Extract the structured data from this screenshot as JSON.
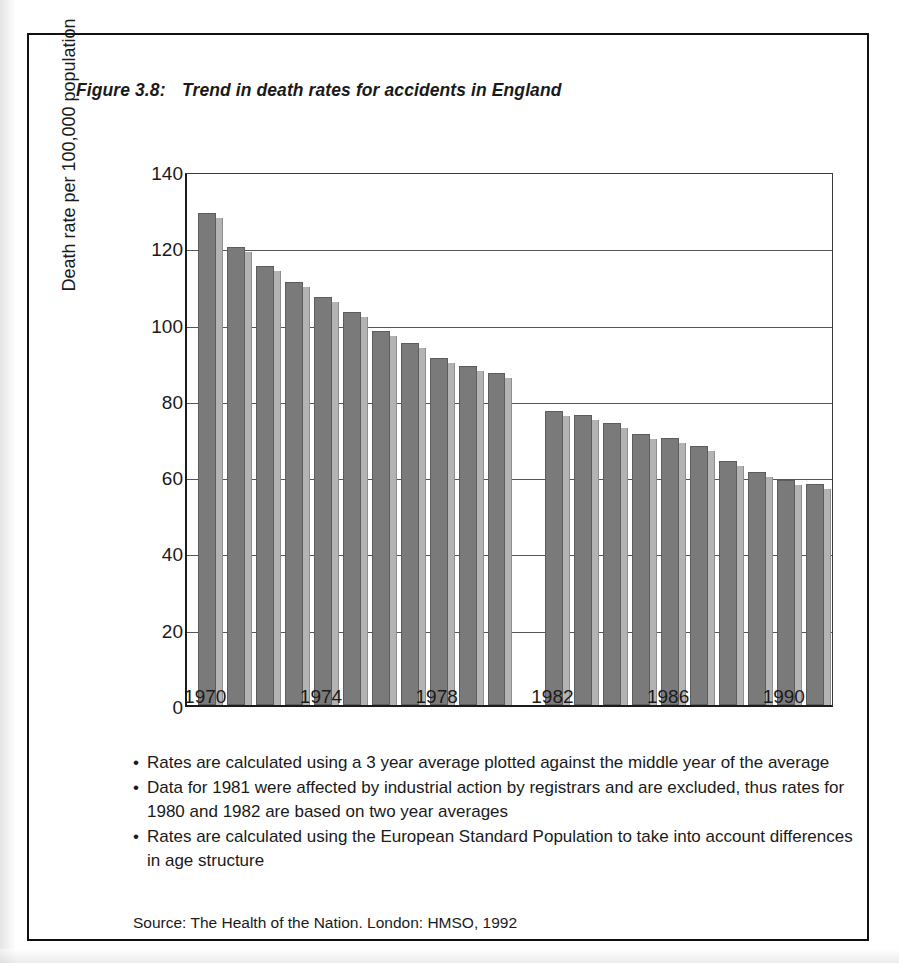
{
  "figure": {
    "number": "Figure 3.8:",
    "title": "Trend in death rates for accidents in England"
  },
  "notes": {
    "bullet_glyph": "•",
    "items": [
      "Rates are calculated using a 3 year average plotted against the middle year of the average",
      "Data for 1981 were affected by industrial action by registrars and are excluded, thus rates for 1980 and 1982 are based on two year averages",
      "Rates are calculated using the European Standard Population to take into account differences in age structure"
    ]
  },
  "source": "Source: The Health of the Nation. London: HMSO, 1992",
  "colors": {
    "bar_face": "#7a7a7a",
    "bar_side": "#b3b3b3",
    "axis": "#1b1b1b",
    "gridline": "#555555",
    "background": "#ffffff"
  },
  "chart_data": {
    "type": "bar",
    "title": "Trend in death rates for accidents in England",
    "xlabel": "",
    "ylabel": "Death rate per 100,000 population",
    "ylim": [
      0,
      140
    ],
    "ytick_values": [
      0,
      20,
      40,
      60,
      80,
      100,
      120,
      140
    ],
    "ytick_labels": [
      "0",
      "20",
      "40",
      "60",
      "80",
      "100",
      "120",
      "140"
    ],
    "xlim": [
      1969.3,
      1991.7
    ],
    "xtick_values": [
      1970,
      1974,
      1978,
      1982,
      1986,
      1990
    ],
    "xtick_labels": [
      "1970",
      "1974",
      "1978",
      "1982",
      "1986",
      "1990"
    ],
    "grid": "horizontal",
    "legend": "none",
    "categories": [
      1970,
      1971,
      1972,
      1973,
      1974,
      1975,
      1976,
      1977,
      1978,
      1979,
      1980,
      1982,
      1983,
      1984,
      1985,
      1986,
      1987,
      1988,
      1989,
      1990,
      1991
    ],
    "values": [
      129,
      120,
      115,
      111,
      107,
      103,
      98,
      95,
      91,
      89,
      87,
      77,
      76,
      74,
      71,
      70,
      68,
      64,
      61,
      59,
      58
    ],
    "missing_years": [
      1981
    ],
    "note": "No bar is plotted for 1981 (data excluded)"
  }
}
